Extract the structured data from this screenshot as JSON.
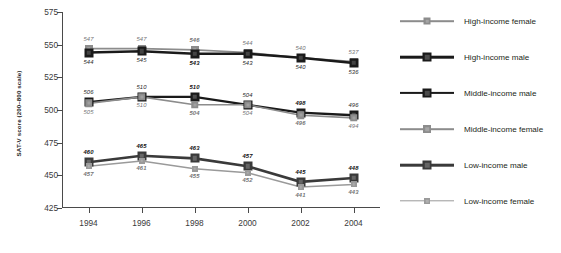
{
  "chart_data": {
    "type": "line",
    "title": "",
    "xlabel": "",
    "ylabel": "SAT-V score (200–800 scale)",
    "x": [
      1994,
      1996,
      1998,
      2000,
      2002,
      2004
    ],
    "xtick_labels": [
      "1994",
      "1996",
      "1998",
      "2000",
      "2002",
      "2004"
    ],
    "ytick_labels": [
      "425",
      "450",
      "475",
      "500",
      "525",
      "550",
      "575"
    ],
    "yticks": [
      425,
      450,
      475,
      500,
      525,
      550,
      575
    ],
    "ylim": [
      425,
      575
    ],
    "xlim": [
      1993,
      2005
    ],
    "grid": false,
    "legend_position": "right",
    "series": [
      {
        "name": "High-income female",
        "color": "#8c8c8c",
        "values": [
          547,
          547,
          546,
          544,
          540,
          537
        ],
        "labels": [
          "547",
          "547",
          "546",
          "544",
          "540",
          "537"
        ],
        "label_side": [
          "above",
          "above",
          "above",
          "above",
          "above",
          "above"
        ],
        "label_bold": [
          false,
          false,
          true,
          false,
          false,
          false
        ]
      },
      {
        "name": "High-income male",
        "color": "#1a1a1a",
        "values": [
          544,
          545,
          543,
          543,
          540,
          536
        ],
        "labels": [
          "544",
          "545",
          "543",
          "543",
          "540",
          "536"
        ],
        "label_side": [
          "below",
          "below",
          "below",
          "below",
          "below",
          "below"
        ],
        "label_bold": [
          false,
          false,
          true,
          false,
          false,
          false
        ]
      },
      {
        "name": "Middle-income male",
        "color": "#1a1a1a",
        "values": [
          506,
          510,
          510,
          504,
          498,
          496
        ],
        "labels": [
          "506",
          "510",
          "510",
          "504",
          "498",
          "496"
        ],
        "label_side": [
          "above",
          "above",
          "above",
          "above",
          "above",
          "above"
        ],
        "label_bold": [
          false,
          false,
          true,
          false,
          true,
          false
        ]
      },
      {
        "name": "Middle-income female",
        "color": "#8c8c8c",
        "values": [
          505,
          510,
          504,
          504,
          496,
          494
        ],
        "labels": [
          "505",
          "510",
          "504",
          "504",
          "496",
          "494"
        ],
        "label_side": [
          "below",
          "below",
          "below",
          "below",
          "below",
          "below"
        ],
        "label_bold": [
          false,
          false,
          true,
          false,
          true,
          false
        ]
      },
      {
        "name": "Low-income male",
        "color": "#3a3a3a",
        "values": [
          460,
          465,
          463,
          457,
          445,
          448
        ],
        "labels": [
          "460",
          "465",
          "463",
          "457",
          "445",
          "448"
        ],
        "label_side": [
          "above",
          "above",
          "above",
          "above",
          "above",
          "above"
        ],
        "label_bold": [
          true,
          true,
          true,
          true,
          true,
          true
        ]
      },
      {
        "name": "Low-income female",
        "color": "#9a9a9a",
        "values": [
          457,
          461,
          455,
          452,
          441,
          443
        ],
        "labels": [
          "457",
          "461",
          "455",
          "452",
          "441",
          "443"
        ],
        "label_side": [
          "below",
          "below",
          "below",
          "below",
          "below",
          "below"
        ],
        "label_bold": [
          true,
          true,
          true,
          true,
          true,
          true
        ]
      }
    ]
  },
  "legend": {
    "items": [
      {
        "label": "High-income female",
        "color": "#8c8c8c",
        "line_width": 1.6,
        "marker": 7
      },
      {
        "label": "High-income male",
        "color": "#1a1a1a",
        "line_width": 2.6,
        "marker": 9
      },
      {
        "label": "Middle-income male",
        "color": "#1a1a1a",
        "line_width": 2.2,
        "marker": 9
      },
      {
        "label": "Middle-income female",
        "color": "#8c8c8c",
        "line_width": 1.6,
        "marker": 8
      },
      {
        "label": "Low-income male",
        "color": "#3a3a3a",
        "line_width": 2.6,
        "marker": 9
      },
      {
        "label": "Low-income female",
        "color": "#9a9a9a",
        "line_width": 1.4,
        "marker": 6
      }
    ]
  }
}
